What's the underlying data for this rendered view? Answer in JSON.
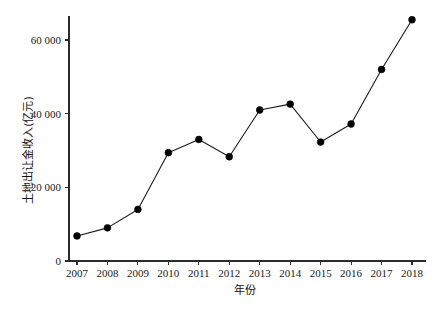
{
  "chart_data": {
    "type": "line",
    "title": "",
    "xlabel": "年份",
    "ylabel": "土地出让金收入(亿元)",
    "categories": [
      2007,
      2008,
      2009,
      2010,
      2011,
      2012,
      2013,
      2014,
      2015,
      2016,
      2017,
      2018
    ],
    "x_tick_labels": [
      "2007",
      "2008",
      "2009",
      "2010",
      "2011",
      "2012",
      "2013",
      "2014",
      "2015",
      "2016",
      "2017",
      "2018"
    ],
    "values": [
      6800,
      9000,
      14000,
      29400,
      33000,
      28300,
      41000,
      42600,
      32300,
      37200,
      52000,
      65500
    ],
    "y_tick_values": [
      0,
      20000,
      40000,
      60000
    ],
    "y_tick_labels": [
      "0",
      "20 000",
      "40 000",
      "60 000"
    ],
    "ylim": [
      0,
      70000
    ],
    "xlim": [
      2006.6,
      2018.5
    ],
    "grid": false,
    "legend": false,
    "marker": "filled-circle",
    "line_color": "#1c1c1c",
    "marker_color": "#000000"
  },
  "figure": {
    "caption": "图 1-1 我国土地出让金收入变化",
    "caption_visible": false
  }
}
